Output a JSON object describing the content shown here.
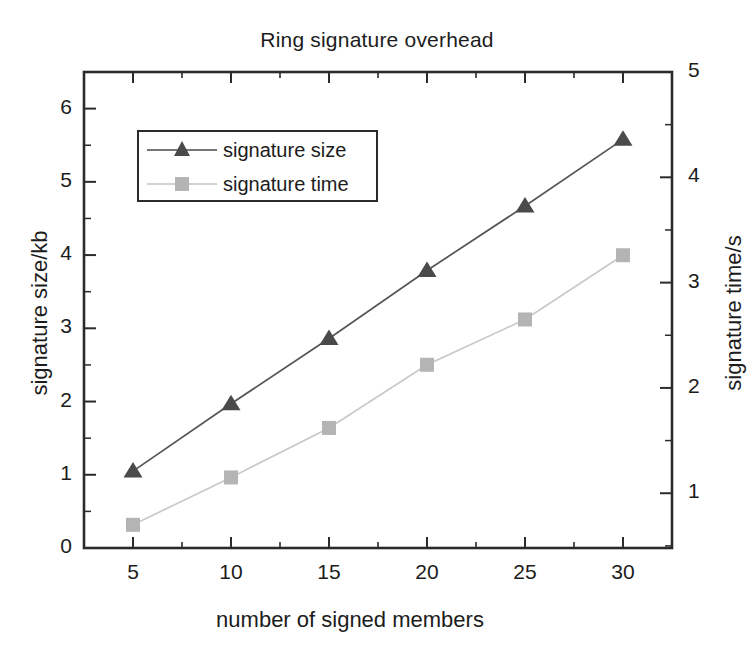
{
  "chart_data": {
    "type": "line",
    "title": "Ring signature overhead",
    "xlabel": "number of signed members",
    "ylabel": "signature size/kb",
    "ylabel_right": "signature time/s",
    "x": [
      5,
      10,
      15,
      20,
      25,
      30
    ],
    "xlim": [
      2.5,
      32.5
    ],
    "xticks": [
      5,
      10,
      15,
      20,
      25,
      30
    ],
    "xtick_labels": [
      "5",
      "10",
      "15",
      "20",
      "25",
      "30"
    ],
    "ylim": [
      0,
      6.5
    ],
    "yticks": [
      0,
      1,
      2,
      3,
      4,
      5,
      6
    ],
    "ytick_labels": [
      "0",
      "1",
      "2",
      "3",
      "4",
      "5",
      "6"
    ],
    "ylim_right": [
      0.48,
      5.0
    ],
    "yticks_right": [
      1,
      2,
      3,
      4,
      5
    ],
    "ytick_labels_right": [
      "1",
      "2",
      "3",
      "4",
      "5"
    ],
    "grid": false,
    "legend_position": "upper left inside",
    "series": [
      {
        "name": "signature size",
        "axis": "left",
        "marker": "triangle",
        "color": "#4a4a4a",
        "values": [
          1.05,
          1.97,
          2.86,
          3.79,
          4.67,
          5.58
        ]
      },
      {
        "name": "signature time",
        "axis": "right",
        "marker": "square",
        "color": "#b4b4b4",
        "values": [
          0.7,
          1.15,
          1.62,
          2.22,
          2.65,
          3.26
        ]
      }
    ]
  },
  "colors": {
    "axis": "#2b2b2b",
    "series_size": "#4a4a4a",
    "series_time": "#b4b4b4",
    "background": "#ffffff"
  }
}
